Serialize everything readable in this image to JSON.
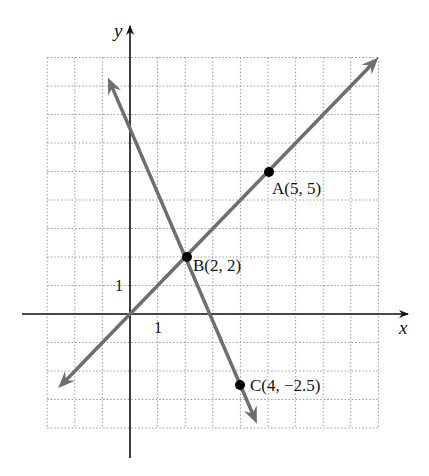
{
  "chart_data": {
    "type": "line",
    "title": "",
    "xlabel": "x",
    "ylabel": "y",
    "xlim": [
      -3,
      9
    ],
    "ylim": [
      -4,
      9
    ],
    "grid": true,
    "grid_step": 1,
    "tick_labels": {
      "x": "1",
      "y": "1"
    },
    "series": [
      {
        "name": "line through A and B",
        "equation": "y = x",
        "slope": 1,
        "intercept": 0,
        "x": [
          -2.6,
          9
        ],
        "y": [
          -2.6,
          9
        ],
        "color": "#6e6e6e"
      },
      {
        "name": "line through B and C",
        "equation": "y = -2.25x + 6.5",
        "slope": -2.25,
        "intercept": 6.5,
        "x": [
          -0.8,
          4.6
        ],
        "y": [
          8.3,
          -3.85
        ],
        "color": "#6e6e6e"
      }
    ],
    "points": [
      {
        "label": "A(5, 5)",
        "x": 5,
        "y": 5
      },
      {
        "label": "B(2, 2)",
        "x": 2,
        "y": 2
      },
      {
        "label": "C(4, −2.5)",
        "x": 4,
        "y": -2.5
      }
    ]
  },
  "labels": {
    "x_axis": "x",
    "y_axis": "y",
    "x_tick": "1",
    "y_tick": "1",
    "point_a": "A(5, 5)",
    "point_b": "B(2, 2)",
    "point_c": "C(4, −2.5)"
  },
  "colors": {
    "axis": "#111111",
    "line": "#6e6e6e",
    "grid": "#9a9a9a",
    "point": "#000000"
  }
}
